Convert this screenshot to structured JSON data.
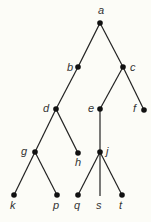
{
  "diagram": {
    "type": "rooted-tree",
    "colors": {
      "background": "#fcfcf7",
      "edge": "#222222",
      "node": "#111111",
      "label": "#333333"
    },
    "nodes": [
      {
        "id": "a",
        "label": "a",
        "x": 100,
        "y": 23,
        "dot": true,
        "lx": 98,
        "ly": 14
      },
      {
        "id": "b",
        "label": "b",
        "x": 78,
        "y": 67,
        "dot": true,
        "lx": 67,
        "ly": 71
      },
      {
        "id": "c",
        "label": "c",
        "x": 123,
        "y": 67,
        "dot": true,
        "lx": 130,
        "ly": 71
      },
      {
        "id": "d",
        "label": "d",
        "x": 56,
        "y": 109,
        "dot": true,
        "lx": 43,
        "ly": 112
      },
      {
        "id": "e",
        "label": "e",
        "x": 100,
        "y": 109,
        "dot": true,
        "lx": 88,
        "ly": 112
      },
      {
        "id": "f",
        "label": "f",
        "x": 144,
        "y": 110,
        "dot": true,
        "lx": 133,
        "ly": 112
      },
      {
        "id": "g",
        "label": "g",
        "x": 35,
        "y": 152,
        "dot": true,
        "lx": 21,
        "ly": 155
      },
      {
        "id": "h",
        "label": "h",
        "x": 78,
        "y": 153,
        "dot": true,
        "lx": 75,
        "ly": 166
      },
      {
        "id": "j",
        "label": "j",
        "x": 100,
        "y": 152,
        "dot": true,
        "lx": 106,
        "ly": 155
      },
      {
        "id": "k",
        "label": "k",
        "x": 14,
        "y": 195,
        "dot": true,
        "lx": 10,
        "ly": 209
      },
      {
        "id": "p",
        "label": "p",
        "x": 57,
        "y": 195,
        "dot": true,
        "lx": 53,
        "ly": 209
      },
      {
        "id": "q",
        "label": "q",
        "x": 78,
        "y": 195,
        "dot": true,
        "lx": 74,
        "ly": 209
      },
      {
        "id": "s",
        "label": "s",
        "x": 100,
        "y": 196,
        "dot": false,
        "lx": 96,
        "ly": 209
      },
      {
        "id": "t",
        "label": "t",
        "x": 122,
        "y": 195,
        "dot": true,
        "lx": 119,
        "ly": 209
      }
    ],
    "edges": [
      [
        "a",
        "b"
      ],
      [
        "a",
        "c"
      ],
      [
        "b",
        "d"
      ],
      [
        "c",
        "e"
      ],
      [
        "c",
        "f"
      ],
      [
        "d",
        "g"
      ],
      [
        "d",
        "h"
      ],
      [
        "e",
        "j"
      ],
      [
        "g",
        "k"
      ],
      [
        "g",
        "p"
      ],
      [
        "j",
        "q"
      ],
      [
        "j",
        "s"
      ],
      [
        "j",
        "t"
      ]
    ]
  }
}
